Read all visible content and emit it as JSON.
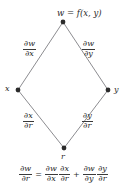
{
  "figure": {
    "type": "chain-rule-tree-diagram",
    "background_color": "#ffffff",
    "line_color": "#6f6f73",
    "node_color": "#2b2b2b",
    "text_color": "#2b2b2b"
  },
  "nodes": {
    "top": {
      "id": "w",
      "label_w": "w",
      "label_eq": " = ",
      "label_f": "f",
      "label_args": "(x, y)",
      "label_full": "w = f(x, y)",
      "x": 63,
      "y": 22
    },
    "left": {
      "id": "x",
      "label": "x",
      "x": 18,
      "y": 90
    },
    "right": {
      "id": "y",
      "label": "y",
      "x": 108,
      "y": 90
    },
    "bottom": {
      "id": "r",
      "label": "r",
      "x": 64,
      "y": 148
    }
  },
  "edges": [
    {
      "name": "w-to-x",
      "from": "w",
      "to": "x",
      "label_numerator": "∂w",
      "label_denominator": "∂x"
    },
    {
      "name": "w-to-y",
      "from": "w",
      "to": "y",
      "label_numerator": "∂w",
      "label_denominator": "∂y"
    },
    {
      "name": "x-to-r",
      "from": "x",
      "to": "r",
      "label_numerator": "∂x",
      "label_denominator": "∂r"
    },
    {
      "name": "y-to-r",
      "from": "y",
      "to": "r",
      "label_numerator": "∂y",
      "label_denominator": "∂r"
    }
  ],
  "equation": {
    "full_text": "∂w/∂r = ∂w/∂x · ∂x/∂r + ∂w/∂y · ∂y/∂r",
    "lhs": {
      "numerator": "∂w",
      "denominator": "∂r"
    },
    "equals": "=",
    "term1": [
      {
        "numerator": "∂w",
        "denominator": "∂x"
      },
      {
        "numerator": "∂x",
        "denominator": "∂r"
      }
    ],
    "plus": "+",
    "term2": [
      {
        "numerator": "∂w",
        "denominator": "∂y"
      },
      {
        "numerator": "∂y",
        "denominator": "∂r"
      }
    ]
  }
}
